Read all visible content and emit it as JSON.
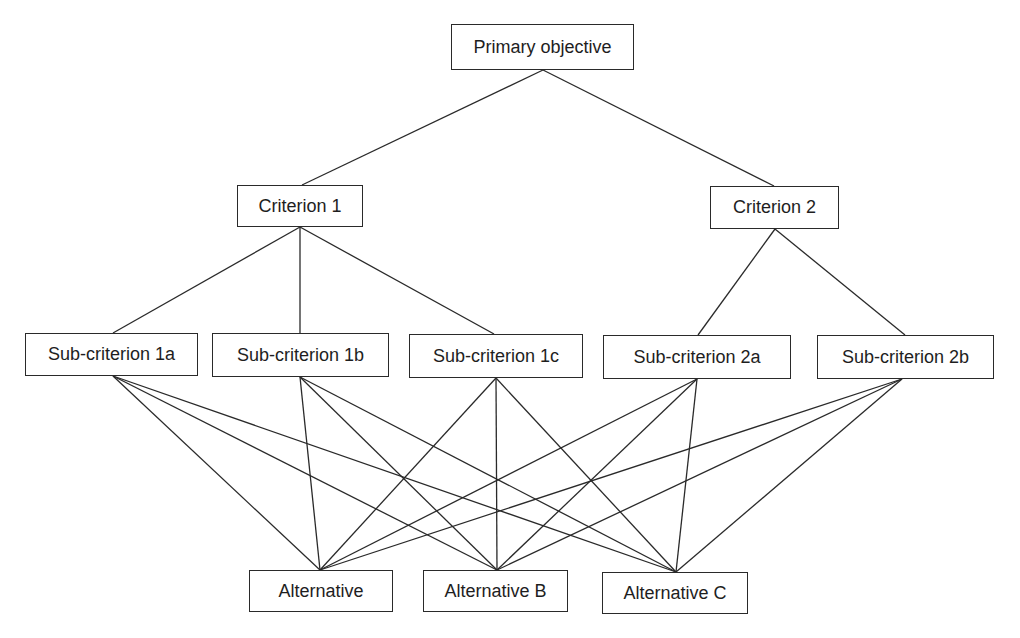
{
  "diagram": {
    "type": "hierarchy",
    "levels": [
      "goal",
      "criteria",
      "sub-criteria",
      "alternatives"
    ],
    "nodes": [
      {
        "id": "goal",
        "label": "Primary objective",
        "x": 451,
        "y": 24,
        "w": 183,
        "h": 46,
        "level": 0
      },
      {
        "id": "c1",
        "label": "Criterion 1",
        "x": 237,
        "y": 185,
        "w": 126,
        "h": 42,
        "level": 1
      },
      {
        "id": "c2",
        "label": "Criterion 2",
        "x": 710,
        "y": 186,
        "w": 129,
        "h": 43,
        "level": 1
      },
      {
        "id": "s1a",
        "label": "Sub-criterion 1a",
        "x": 25,
        "y": 333,
        "w": 173,
        "h": 43,
        "level": 2
      },
      {
        "id": "s1b",
        "label": "Sub-criterion 1b",
        "x": 212,
        "y": 333,
        "w": 177,
        "h": 44,
        "level": 2
      },
      {
        "id": "s1c",
        "label": "Sub-criterion 1c",
        "x": 409,
        "y": 334,
        "w": 174,
        "h": 44,
        "level": 2
      },
      {
        "id": "s2a",
        "label": "Sub-criterion 2a",
        "x": 603,
        "y": 335,
        "w": 188,
        "h": 44,
        "level": 2
      },
      {
        "id": "s2b",
        "label": "Sub-criterion 2b",
        "x": 817,
        "y": 335,
        "w": 177,
        "h": 44,
        "level": 2
      },
      {
        "id": "altA",
        "label": "Alternative",
        "x": 249,
        "y": 570,
        "w": 144,
        "h": 42,
        "level": 3
      },
      {
        "id": "altB",
        "label": "Alternative B",
        "x": 423,
        "y": 570,
        "w": 145,
        "h": 42,
        "level": 3
      },
      {
        "id": "altC",
        "label": "Alternative C",
        "x": 602,
        "y": 572,
        "w": 146,
        "h": 42,
        "level": 3
      }
    ],
    "edges": [
      {
        "from": "goal",
        "to": "c1",
        "x1": 543,
        "y1": 70,
        "x2": 302,
        "y2": 185
      },
      {
        "from": "goal",
        "to": "c2",
        "x1": 543,
        "y1": 70,
        "x2": 774,
        "y2": 186
      },
      {
        "from": "c1",
        "to": "s1a",
        "x1": 300,
        "y1": 227,
        "x2": 113,
        "y2": 333
      },
      {
        "from": "c1",
        "to": "s1b",
        "x1": 300,
        "y1": 227,
        "x2": 300,
        "y2": 333
      },
      {
        "from": "c1",
        "to": "s1c",
        "x1": 300,
        "y1": 227,
        "x2": 494,
        "y2": 334
      },
      {
        "from": "c2",
        "to": "s2a",
        "x1": 775,
        "y1": 229,
        "x2": 698,
        "y2": 335
      },
      {
        "from": "c2",
        "to": "s2b",
        "x1": 775,
        "y1": 229,
        "x2": 905,
        "y2": 335
      },
      {
        "from": "s1a",
        "to": "altA",
        "x1": 113,
        "y1": 376,
        "x2": 320,
        "y2": 570
      },
      {
        "from": "s1a",
        "to": "altB",
        "x1": 113,
        "y1": 376,
        "x2": 497,
        "y2": 570
      },
      {
        "from": "s1a",
        "to": "altC",
        "x1": 113,
        "y1": 376,
        "x2": 676,
        "y2": 572
      },
      {
        "from": "s1b",
        "to": "altA",
        "x1": 300,
        "y1": 377,
        "x2": 320,
        "y2": 570
      },
      {
        "from": "s1b",
        "to": "altB",
        "x1": 300,
        "y1": 377,
        "x2": 497,
        "y2": 570
      },
      {
        "from": "s1b",
        "to": "altC",
        "x1": 300,
        "y1": 377,
        "x2": 676,
        "y2": 572
      },
      {
        "from": "s1c",
        "to": "altA",
        "x1": 496,
        "y1": 378,
        "x2": 320,
        "y2": 570
      },
      {
        "from": "s1c",
        "to": "altB",
        "x1": 496,
        "y1": 378,
        "x2": 497,
        "y2": 570
      },
      {
        "from": "s1c",
        "to": "altC",
        "x1": 496,
        "y1": 378,
        "x2": 676,
        "y2": 572
      },
      {
        "from": "s2a",
        "to": "altA",
        "x1": 697,
        "y1": 379,
        "x2": 320,
        "y2": 570
      },
      {
        "from": "s2a",
        "to": "altB",
        "x1": 697,
        "y1": 379,
        "x2": 497,
        "y2": 570
      },
      {
        "from": "s2a",
        "to": "altC",
        "x1": 697,
        "y1": 379,
        "x2": 676,
        "y2": 572
      },
      {
        "from": "s2b",
        "to": "altA",
        "x1": 902,
        "y1": 379,
        "x2": 320,
        "y2": 570
      },
      {
        "from": "s2b",
        "to": "altB",
        "x1": 902,
        "y1": 379,
        "x2": 497,
        "y2": 570
      },
      {
        "from": "s2b",
        "to": "altC",
        "x1": 902,
        "y1": 379,
        "x2": 676,
        "y2": 572
      }
    ]
  }
}
